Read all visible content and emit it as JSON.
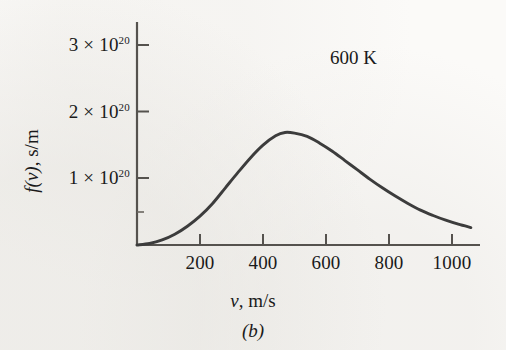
{
  "figure": {
    "caption": "(b)",
    "annotation": "600 K",
    "curve_color": "#3c3c3c",
    "axis_color": "#55524e",
    "background_color": "#fbfaf8"
  },
  "axes": {
    "y_title_main": "f(v)",
    "y_title_units": ", s/m",
    "x_title_var": "v",
    "x_title_units": ", m/s",
    "y_ticks": [
      {
        "mantissa": "1",
        "times": "×",
        "base": "10",
        "exponent": "20",
        "value": 1e+20
      },
      {
        "mantissa": "2",
        "times": "×",
        "base": "10",
        "exponent": "20",
        "value": 2e+20
      },
      {
        "mantissa": "3",
        "times": "×",
        "base": "10",
        "exponent": "20",
        "value": 3e+20
      }
    ],
    "x_ticks": [
      {
        "label": "200",
        "value": 200
      },
      {
        "label": "400",
        "value": 400
      },
      {
        "label": "600",
        "value": 600
      },
      {
        "label": "800",
        "value": 800
      },
      {
        "label": "1000",
        "value": 1000
      }
    ]
  },
  "chart_data": {
    "type": "line",
    "title": "",
    "subtitle": "",
    "xlabel": "v, m/s",
    "ylabel": "f(v), s/m",
    "annotations": [
      {
        "text": "600 K",
        "x": 760,
        "y": 2.9e+20
      }
    ],
    "grid": false,
    "legend": null,
    "xlim": [
      0,
      1080
    ],
    "ylim": [
      0,
      3.35e+20
    ],
    "x_tick_values": [
      200,
      400,
      600,
      800,
      1000
    ],
    "y_tick_values": [
      1e+20,
      2e+20,
      3e+20
    ],
    "series": [
      {
        "name": "Maxwell-Boltzmann speed distribution at 600 K",
        "peak_x": 470,
        "peak_y": 1.68e+20,
        "x": [
          0,
          40,
          80,
          120,
          160,
          200,
          240,
          280,
          320,
          360,
          400,
          440,
          470,
          500,
          540,
          580,
          620,
          660,
          700,
          740,
          780,
          820,
          860,
          900,
          940,
          980,
          1020,
          1060
        ],
        "values": [
          0.0,
          2.2e+18,
          7.5e+18,
          1.6e+19,
          2.8e+19,
          4.3e+19,
          6.2e+19,
          8.5e+19,
          1.08e+20,
          1.3e+20,
          1.49e+20,
          1.63e+20,
          1.68e+20,
          1.67e+20,
          1.62e+20,
          1.52e+20,
          1.4e+20,
          1.26e+20,
          1.12e+20,
          9.8e+19,
          8.5e+19,
          7.3e+19,
          6.2e+19,
          5.2e+19,
          4.4e+19,
          3.7e+19,
          3.1e+19,
          2.6e+19
        ]
      }
    ]
  }
}
